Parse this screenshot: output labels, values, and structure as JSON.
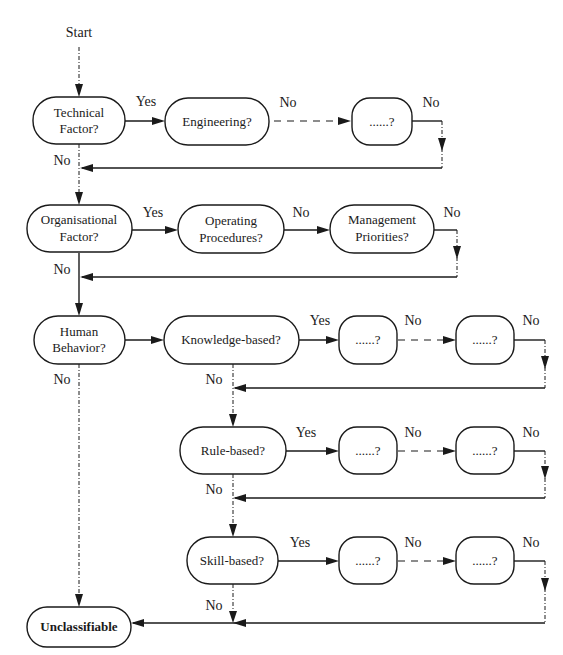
{
  "diagram": {
    "title": "",
    "start_label": "Start",
    "yes_label": "Yes",
    "no_label": "No",
    "nodes": {
      "technical": [
        "Technical",
        "Factor?"
      ],
      "engineering": "Engineering?",
      "tech_more": "......?",
      "organisational": [
        "Organisational",
        "Factor?"
      ],
      "operating": [
        "Operating",
        "Procedures?"
      ],
      "management": [
        "Management",
        "Priorities?"
      ],
      "human": [
        "Human",
        "Behavior?"
      ],
      "knowledge": "Knowledge-based?",
      "kb_a": "......?",
      "kb_b": "......?",
      "rule": "Rule-based?",
      "rb_a": "......?",
      "rb_b": "......?",
      "skill": "Skill-based?",
      "sb_a": "......?",
      "sb_b": "......?",
      "unclassifiable": "Unclassifiable"
    },
    "colors": {
      "ink": "#1a1a1a",
      "background": "#ffffff"
    }
  }
}
